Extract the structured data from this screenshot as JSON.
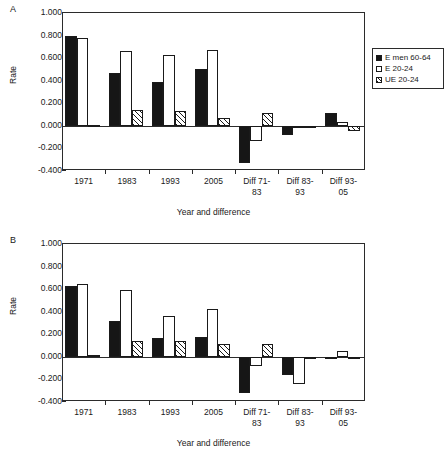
{
  "figure": {
    "panels": [
      {
        "letter": "A"
      },
      {
        "letter": "B"
      }
    ]
  },
  "chart_data": [
    {
      "type": "bar",
      "panel": "A",
      "title": "",
      "xlabel": "Year and difference",
      "ylabel": "Rate",
      "ylim": [
        -0.4,
        1.0
      ],
      "ytick_labels": [
        "1.000",
        "0.800",
        "0.600",
        "0.400",
        "0.200",
        "0.000",
        "-0.200",
        "-0.400"
      ],
      "ytick_values": [
        1.0,
        0.8,
        0.6,
        0.4,
        0.2,
        0.0,
        -0.2,
        -0.4
      ],
      "grid": false,
      "legend_position": "right",
      "categories": [
        "1971",
        "1983",
        "1993",
        "2005",
        "Diff 71-\n83",
        "Diff 83-\n93",
        "Diff 93-\n05"
      ],
      "series": [
        {
          "name": "E men 60-64",
          "values": [
            0.8,
            0.468,
            0.385,
            0.508,
            -0.333,
            -0.085,
            0.112
          ]
        },
        {
          "name": "E 20-24",
          "values": [
            0.782,
            0.66,
            0.627,
            0.67,
            -0.13,
            -0.022,
            0.035
          ]
        },
        {
          "name": "UE 20-24",
          "values": [
            0.012,
            0.143,
            0.13,
            0.072,
            0.113,
            -0.008,
            -0.048
          ]
        }
      ]
    },
    {
      "type": "bar",
      "panel": "B",
      "title": "",
      "xlabel": "Year and difference",
      "ylabel": "Rate",
      "ylim": [
        -0.4,
        1.0
      ],
      "ytick_labels": [
        "1.000",
        "0.800",
        "0.600",
        "0.400",
        "0.200",
        "0.000",
        "-0.200",
        "-0.400"
      ],
      "ytick_values": [
        1.0,
        0.8,
        0.6,
        0.4,
        0.2,
        0.0,
        -0.2,
        -0.4
      ],
      "grid": false,
      "legend_position": "right",
      "categories": [
        "1971",
        "1983",
        "1993",
        "2005",
        "Diff 71-\n83",
        "Diff 83-\n93",
        "Diff 93-\n05"
      ],
      "series": [
        {
          "name": "E men 60-64",
          "values": [
            0.627,
            0.315,
            0.17,
            0.172,
            -0.32,
            -0.16,
            -0.005
          ]
        },
        {
          "name": "E 20-24",
          "values": [
            0.645,
            0.588,
            0.365,
            0.42,
            -0.078,
            -0.237,
            0.048
          ]
        },
        {
          "name": "UE 20-24",
          "values": [
            0.015,
            0.14,
            0.138,
            0.115,
            0.112,
            -0.002,
            -0.012
          ]
        }
      ]
    }
  ],
  "colors": {
    "series_0": "#161616",
    "series_1": "#ffffff",
    "series_2": "#ffffff",
    "axis": "#2b2b2b",
    "text": "#1a1a1a"
  }
}
